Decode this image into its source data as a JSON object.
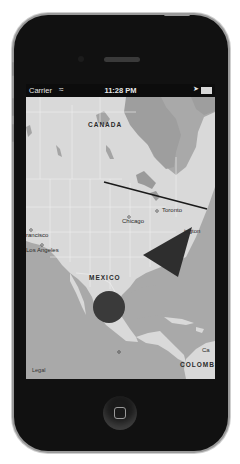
{
  "status_bar": {
    "carrier": "Carrier",
    "wifi_icon": "wifi-icon",
    "time": "11:28 PM",
    "location_icon": "location-arrow-icon",
    "battery_icon": "battery-icon"
  },
  "map": {
    "labels": {
      "canada": "CANADA",
      "chicago": "Chicago",
      "toronto": "Toronto",
      "washington": "ington",
      "san_francisco": "rancisco",
      "los_angeles": "Los Angeles",
      "mexico": "MEXICO",
      "colombia": "COLOMBI",
      "ca_partial": "Ca",
      "legal": "Legal"
    },
    "overlays": {
      "polyline": {
        "color": "#1a1a1a"
      },
      "polygon": {
        "color": "#2e2e2e"
      },
      "circle": {
        "color": "#3a3a3a"
      }
    },
    "colors": {
      "land": "#d9d9d9",
      "water": "#a9a9a9",
      "borders": "#f2f2f2"
    }
  },
  "device": {
    "home_button_icon": "home-button-icon"
  }
}
